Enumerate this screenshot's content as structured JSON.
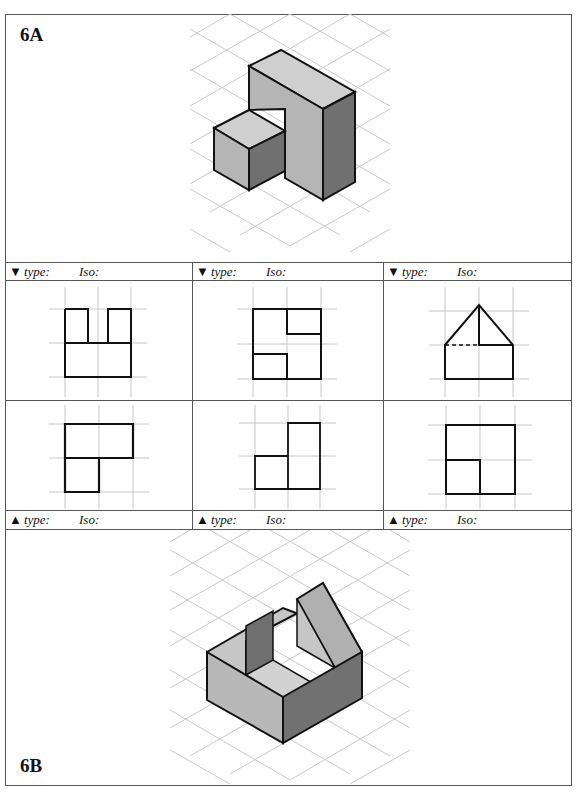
{
  "document": {
    "top_cut_text": "... and sketching (... multiview ... iso ...) ... the ... pictorial ... complete ... problem"
  },
  "panel_a": {
    "label": "6A",
    "description": "Isometric pictorial: tall rectangular block with smaller cube attached at front-left"
  },
  "panel_b": {
    "label": "6B",
    "description": "Isometric pictorial: U-shaped block with wedge/ramp feature at rear right"
  },
  "views": {
    "top_row": [
      {
        "arrow": "▼",
        "type_label": "type:",
        "iso_label": "Iso:",
        "shape": "front-notched-U"
      },
      {
        "arrow": "▼",
        "type_label": "type:",
        "iso_label": "Iso:",
        "shape": "square-with-two-corner-notches"
      },
      {
        "arrow": "▼",
        "type_label": "type:",
        "iso_label": "Iso:",
        "shape": "pentagon-house-with-hidden-line"
      }
    ],
    "bottom_row": [
      {
        "arrow": "▲",
        "type_label": "type:",
        "iso_label": "Iso:",
        "shape": "inverted-L"
      },
      {
        "arrow": "▲",
        "type_label": "type:",
        "iso_label": "Iso:",
        "shape": "L-step"
      },
      {
        "arrow": "▲",
        "type_label": "type:",
        "iso_label": "Iso:",
        "shape": "square-with-inner-corner"
      }
    ]
  },
  "colors": {
    "border": "#555555",
    "grid": "#c8c8c8",
    "face_light": "#c9c9c9",
    "face_mid": "#a8a8a8",
    "face_dark": "#6f6f6f",
    "outline": "#111111"
  }
}
